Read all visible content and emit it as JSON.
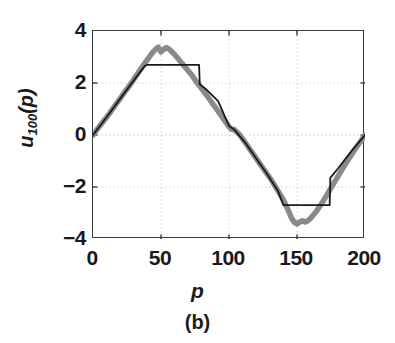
{
  "figure": {
    "caption": "(b)"
  },
  "chart_data": {
    "type": "line",
    "title": "",
    "subtitle": "",
    "xlabel": "p",
    "ylabel": "u_100(p)",
    "ylabel_base": "u",
    "ylabel_subscript": "100",
    "ylabel_arg": "(p)",
    "xlim": [
      0,
      200
    ],
    "ylim": [
      -4,
      4
    ],
    "xticks": [
      0,
      50,
      100,
      150,
      200
    ],
    "xticklabels": [
      "0",
      "50",
      "100",
      "150",
      "200"
    ],
    "yticks": [
      -4,
      -2,
      0,
      2,
      4
    ],
    "yticklabels": [
      "−4",
      "−2",
      "0",
      "2",
      "4"
    ],
    "grid": true,
    "grid_style": "dotted",
    "grid_color": "#c8c8c8",
    "legend": "none",
    "axis_color": "#3a3a3a",
    "series": [
      {
        "name": "unsaturated-noisy-response",
        "color": "#8a8a8a",
        "linewidth": 5.5,
        "style": "solid",
        "description": "Thick gray noisy triangular waveform peaking near +3.4 and -3.4",
        "x": [
          0,
          4,
          8,
          12,
          16,
          20,
          24,
          28,
          32,
          36,
          40,
          42,
          44,
          46,
          48,
          50,
          52,
          54,
          56,
          58,
          60,
          64,
          68,
          72,
          76,
          80,
          84,
          88,
          92,
          96,
          100,
          102,
          104,
          108,
          112,
          116,
          120,
          124,
          128,
          132,
          136,
          140,
          144,
          146,
          148,
          150,
          152,
          154,
          156,
          158,
          160,
          164,
          168,
          172,
          176,
          180,
          184,
          188,
          192,
          196,
          200
        ],
        "y": [
          0.0,
          0.28,
          0.55,
          0.82,
          1.12,
          1.4,
          1.7,
          1.98,
          2.3,
          2.6,
          2.9,
          3.05,
          3.18,
          3.3,
          3.38,
          3.2,
          3.3,
          3.36,
          3.3,
          3.2,
          3.1,
          2.85,
          2.6,
          2.35,
          2.05,
          1.78,
          1.5,
          1.2,
          0.92,
          0.62,
          0.32,
          0.22,
          0.2,
          0.0,
          -0.3,
          -0.6,
          -0.9,
          -1.2,
          -1.5,
          -1.8,
          -2.15,
          -2.5,
          -2.95,
          -3.2,
          -3.35,
          -3.42,
          -3.35,
          -3.3,
          -3.35,
          -3.3,
          -3.2,
          -2.95,
          -2.65,
          -2.3,
          -1.95,
          -1.6,
          -1.25,
          -0.92,
          -0.6,
          -0.3,
          0.0
        ]
      },
      {
        "name": "saturated-clipped-response",
        "color": "#1a1a1a",
        "linewidth": 1.8,
        "style": "solid",
        "description": "Thin black waveform clipped (saturated) at +2.7 and -2.7 with flat plateaus and vertical transitions",
        "x": [
          0,
          10,
          20,
          30,
          38,
          40,
          60,
          78,
          78.5,
          84,
          92,
          100,
          104,
          112,
          120,
          128,
          136,
          140,
          150,
          160,
          174,
          174.5,
          180,
          190,
          200
        ],
        "y": [
          0.0,
          0.68,
          1.4,
          2.1,
          2.65,
          2.7,
          2.7,
          2.7,
          1.95,
          1.72,
          1.3,
          0.35,
          0.2,
          -0.3,
          -0.9,
          -1.5,
          -2.15,
          -2.7,
          -2.7,
          -2.7,
          -2.7,
          -1.65,
          -1.3,
          -0.62,
          0.0
        ]
      }
    ]
  }
}
